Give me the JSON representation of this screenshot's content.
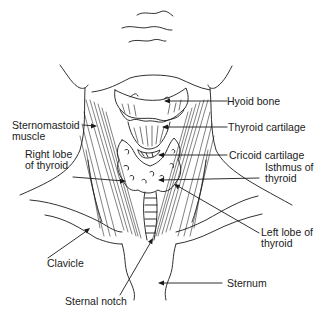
{
  "diagram": {
    "labels": {
      "hyoid_bone": "Hyoid bone",
      "thyroid_cartilage": "Thyroid cartilage",
      "sternomastoid_1": "Sternomastoid",
      "sternomastoid_2": "muscle",
      "right_lobe_1": "Right lobe",
      "right_lobe_2": "of thyroid",
      "cricoid_cartilage": "Cricoid cartilage",
      "isthmus_1": "Isthmus of",
      "isthmus_2": "thyroid",
      "left_lobe_1": "Left lobe of",
      "left_lobe_2": "thyroid",
      "clavicle": "Clavicle",
      "sternum": "Sternum",
      "sternal_notch": "Sternal notch"
    },
    "colors": {
      "line": "#1a1a1a",
      "background": "#ffffff"
    }
  }
}
